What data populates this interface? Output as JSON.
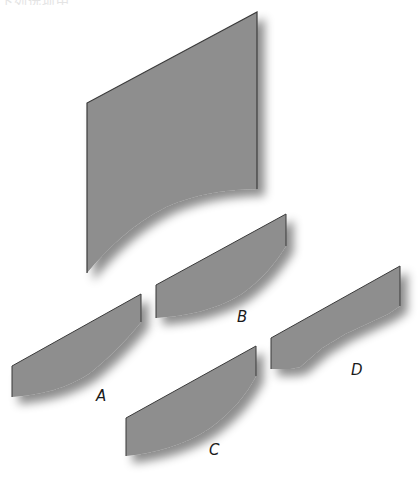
{
  "header": {
    "clipped_text": "下列选项中"
  },
  "figure": {
    "fill_color": "#8e8e8e",
    "edge_color": "#3a3a3a",
    "shadow_color": "#7a7a7a",
    "main_shape": {
      "description": "large parallelogram sheet with concave curved bottom edge"
    },
    "options": [
      {
        "label": "A"
      },
      {
        "label": "B"
      },
      {
        "label": "C"
      },
      {
        "label": "D"
      }
    ]
  }
}
